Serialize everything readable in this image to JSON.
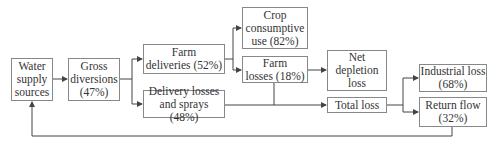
{
  "diagram": {
    "nodes": {
      "water_supply": "Water\nsupply\nsources",
      "gross_diversions": "Gross\ndiversions\n(47%)",
      "farm_deliveries": "Farm\ndeliveries (52%)",
      "delivery_losses": "Delivery losses\nand sprays (48%)",
      "crop_use": "Crop\nconsumptive\nuse (82%)",
      "farm_losses": "Farm\nlosses (18%)",
      "net_depletion": "Net\ndepletion\nloss",
      "total_loss": "Total loss",
      "industrial_loss": "Industrial loss\n(68%)",
      "return_flow": "Return flow\n(32%)"
    },
    "edges": [
      [
        "Water supply sources",
        "Gross diversions"
      ],
      [
        "Gross diversions",
        "Farm deliveries"
      ],
      [
        "Gross diversions",
        "Delivery losses and sprays"
      ],
      [
        "Farm deliveries",
        "Crop consumptive use"
      ],
      [
        "Farm deliveries",
        "Farm losses"
      ],
      [
        "Farm losses",
        "Net depletion loss"
      ],
      [
        "Farm losses",
        "Total loss"
      ],
      [
        "Delivery losses and sprays",
        "Total loss"
      ],
      [
        "Total loss",
        "Industrial loss"
      ],
      [
        "Total loss",
        "Return flow"
      ],
      [
        "Return flow",
        "Water supply sources"
      ]
    ]
  }
}
